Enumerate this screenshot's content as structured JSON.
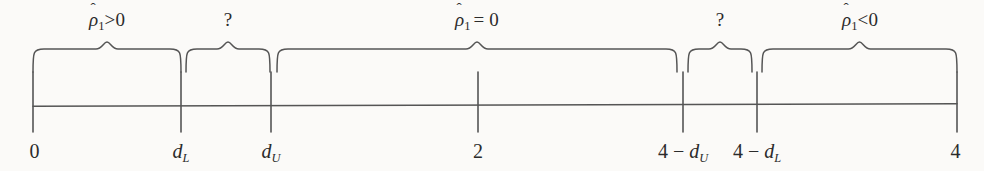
{
  "figure": {
    "type": "number-line-diagram",
    "background_color": "#fbfaf8",
    "ink_color": "#555555",
    "axis": {
      "y": 105,
      "x_start": 33,
      "x_end": 957,
      "tick_top": 72,
      "tick_bottom": 132
    },
    "ticks": [
      {
        "name": "zero",
        "x": 33,
        "label_parts": {
          "text": "0"
        }
      },
      {
        "name": "d-lower",
        "x": 181,
        "label_parts": {
          "base": "d",
          "sub": "L"
        }
      },
      {
        "name": "d-upper",
        "x": 271,
        "label_parts": {
          "base": "d",
          "sub": "U"
        }
      },
      {
        "name": "two",
        "x": 478,
        "label_parts": {
          "text": "2"
        }
      },
      {
        "name": "four-minus-d-upper",
        "x": 683,
        "label_parts": {
          "prefix": "4 − ",
          "base": "d",
          "sub": "U"
        }
      },
      {
        "name": "four-minus-d-lower",
        "x": 757,
        "label_parts": {
          "prefix": "4 − ",
          "base": "d",
          "sub": "L"
        }
      },
      {
        "name": "four",
        "x": 957,
        "label_parts": {
          "text": "4"
        }
      }
    ],
    "tick_labels": {
      "zero": "0",
      "d_lower": "d",
      "d_lower_sub": "L",
      "d_upper": "d",
      "d_upper_sub": "U",
      "two": "2",
      "four_minus_d_upper_prefix": "4 − ",
      "four_minus_d_upper": "d",
      "four_minus_d_upper_sub": "U",
      "four_minus_d_lower_prefix": "4 − ",
      "four_minus_d_lower": "d",
      "four_minus_d_lower_sub": "L",
      "four": "4"
    },
    "regions": [
      {
        "name": "positive-autocorrelation",
        "brace_start": 33,
        "brace_end": 181,
        "label_center": 107,
        "label_kind": "rho",
        "rho": "ρ",
        "hat": "ˆ",
        "subscript": "1",
        "relation": ">0"
      },
      {
        "name": "inconclusive-left",
        "brace_start": 186,
        "brace_end": 270,
        "label_center": 228,
        "label_kind": "question",
        "text": "?"
      },
      {
        "name": "no-autocorrelation",
        "brace_start": 277,
        "brace_end": 677,
        "label_center": 477,
        "label_kind": "rho",
        "rho": "ρ",
        "hat": "ˆ",
        "subscript": "1",
        "relation": "= 0"
      },
      {
        "name": "inconclusive-right",
        "brace_start": 688,
        "brace_end": 752,
        "label_center": 720,
        "label_kind": "question",
        "text": "?"
      },
      {
        "name": "negative-autocorrelation",
        "brace_start": 762,
        "brace_end": 957,
        "label_center": 860,
        "label_kind": "rho",
        "rho": "ρ",
        "hat": "ˆ",
        "subscript": "1",
        "relation": "<0"
      }
    ]
  }
}
